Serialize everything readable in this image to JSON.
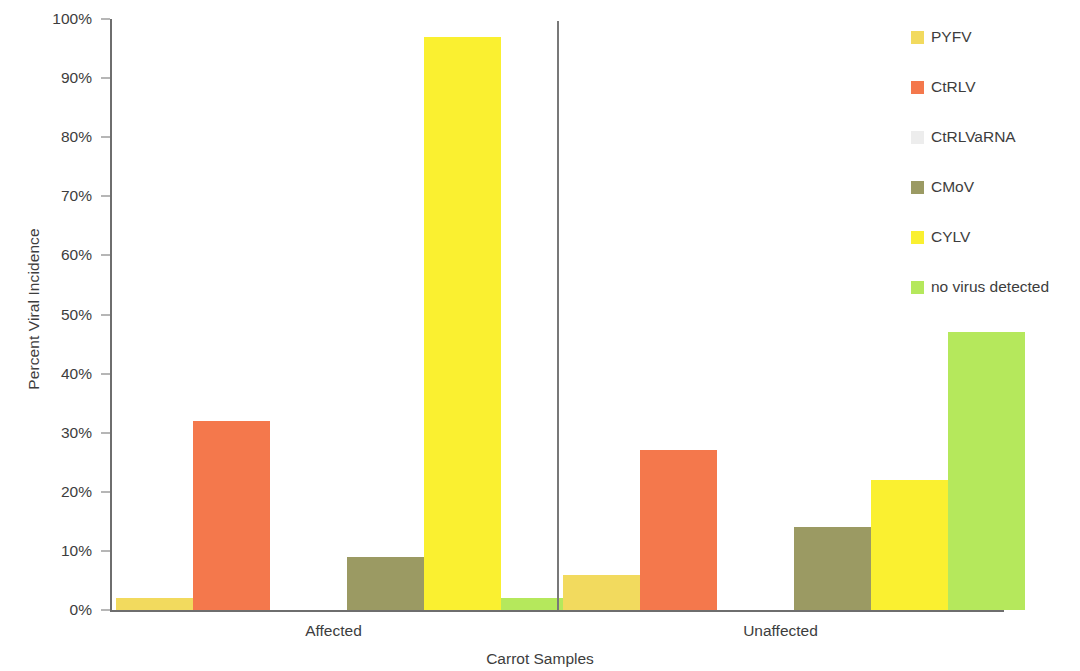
{
  "chart_data": {
    "type": "bar",
    "title": "",
    "xlabel": "Carrot Samples",
    "ylabel": "Percent Viral Incidence",
    "categories": [
      "Affected",
      "Unaffected"
    ],
    "ylim": [
      0,
      100
    ],
    "y_tick_labels": [
      "0%",
      "10%",
      "20%",
      "30%",
      "40%",
      "50%",
      "60%",
      "70%",
      "80%",
      "90%",
      "100%"
    ],
    "y_tick_values": [
      0,
      10,
      20,
      30,
      40,
      50,
      60,
      70,
      80,
      90,
      100
    ],
    "grid": false,
    "legend_position": "right",
    "series": [
      {
        "name": "PYFV",
        "color": "#F2DA5E",
        "values": [
          2,
          6
        ]
      },
      {
        "name": "CtRLV",
        "color": "#F4784C",
        "values": [
          32,
          27
        ]
      },
      {
        "name": "CtRLVaRNA",
        "color": "#EDEDED",
        "values": [
          0,
          0
        ]
      },
      {
        "name": "CMoV",
        "color": "#9B9A63",
        "values": [
          9,
          14
        ]
      },
      {
        "name": "CYLV",
        "color": "#FAF030",
        "values": [
          97,
          22
        ]
      },
      {
        "name": "no virus detected",
        "color": "#B5E85C",
        "values": [
          2,
          47
        ]
      }
    ]
  },
  "axis": {
    "y_title": "Percent Viral Incidence",
    "x_title": "Carrot Samples"
  }
}
